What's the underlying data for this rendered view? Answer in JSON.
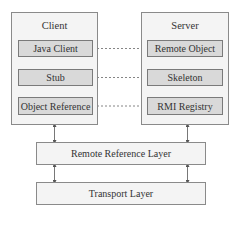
{
  "diagram": {
    "type": "architecture",
    "client": {
      "label": "Client",
      "components": [
        "Java Client",
        "Stub",
        "Object Reference"
      ]
    },
    "server": {
      "label": "Server",
      "components": [
        "Remote Object",
        "Skeleton",
        "RMI Registry"
      ]
    },
    "layers": [
      "Remote Reference Layer",
      "Transport Layer"
    ],
    "connections": [
      {
        "from": "Java Client",
        "to": "Remote Object",
        "style": "dashed"
      },
      {
        "from": "Stub",
        "to": "Skeleton",
        "style": "dashed"
      },
      {
        "from": "Object Reference",
        "to": "RMI Registry",
        "style": "dashed"
      },
      {
        "from": "Java Client",
        "to": "Stub",
        "style": "bidirectional-arrow"
      },
      {
        "from": "Stub",
        "to": "Object Reference",
        "style": "bidirectional-arrow"
      },
      {
        "from": "Remote Object",
        "to": "Skeleton",
        "style": "bidirectional-arrow"
      },
      {
        "from": "Skeleton",
        "to": "RMI Registry",
        "style": "bidirectional-arrow"
      },
      {
        "from": "Client",
        "to": "Remote Reference Layer",
        "style": "bidirectional-arrow"
      },
      {
        "from": "Server",
        "to": "Remote Reference Layer",
        "style": "bidirectional-arrow"
      },
      {
        "from": "Remote Reference Layer",
        "to": "Transport Layer",
        "style": "bidirectional-arrow",
        "count": 2
      }
    ],
    "colors": {
      "group_fill": "#f4f4f4",
      "component_fill": "#d9d9d9",
      "border": "#8a8a8a",
      "line": "#555555"
    }
  }
}
